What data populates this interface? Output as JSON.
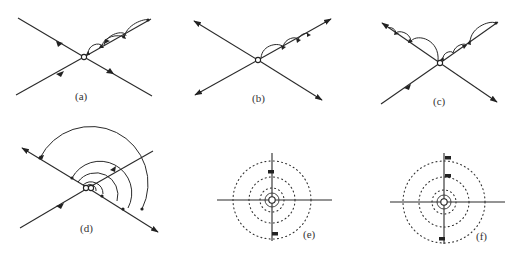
{
  "figure": {
    "panels": [
      {
        "id": "a",
        "label": "(a)",
        "description": "Two crossing lines, all arrows pointing inward toward the vertex; chain of small loops on upper-right branch"
      },
      {
        "id": "b",
        "label": "(b)",
        "description": "Two crossing lines, all arrows pointing outward; chain of loops on upper-right branch"
      },
      {
        "id": "c",
        "label": "(c)",
        "description": "Crossing lines with loops on both upper branches; mixed arrow directions"
      },
      {
        "id": "d",
        "label": "(d)",
        "description": "Nested semicircular arcs around vertex spanning both branches"
      },
      {
        "id": "e",
        "label": "(e)",
        "description": "Horizontal and vertical axes with concentric dotted circles around vertex; markers on vertical axis"
      },
      {
        "id": "f",
        "label": "(f)",
        "description": "Axes with concentric dotted circles; three markers on vertical axis"
      }
    ],
    "colors": {
      "stroke": "#2a2a2a",
      "background": "#ffffff"
    }
  }
}
